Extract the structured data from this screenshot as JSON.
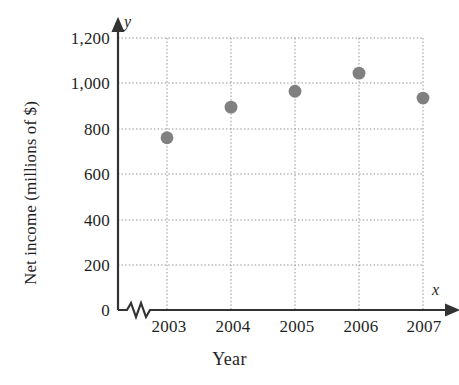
{
  "chart_data": {
    "type": "scatter",
    "title": "",
    "xlabel": "Year",
    "ylabel": "Net income (millions of $)",
    "x_axis_variable": "x",
    "y_axis_variable": "y",
    "categories": [
      "2003",
      "2004",
      "2005",
      "2006",
      "2007"
    ],
    "x": [
      2003,
      2004,
      2005,
      2006,
      2007
    ],
    "values": [
      760,
      895,
      965,
      1045,
      935
    ],
    "series": [
      {
        "name": "Net income",
        "values": [
          760,
          895,
          965,
          1045,
          935
        ]
      }
    ],
    "points": [
      {
        "label": "2003",
        "x": 2003,
        "y": 760
      },
      {
        "label": "2004",
        "x": 2004,
        "y": 895
      },
      {
        "label": "2005",
        "x": 2005,
        "y": 965
      },
      {
        "label": "2006",
        "x": 2006,
        "y": 1045
      },
      {
        "label": "2007",
        "x": 2007,
        "y": 935
      }
    ],
    "ylim": [
      0,
      1200
    ],
    "ytick_values": [
      0,
      200,
      400,
      600,
      800,
      1000,
      1200
    ],
    "ytick_labels": [
      "0",
      "200",
      "400",
      "600",
      "800",
      "1,000",
      "1,200"
    ],
    "xtick_labels": [
      "2003",
      "2004",
      "2005",
      "2006",
      "2007"
    ],
    "grid": "dotted-both-axes",
    "legend": "none",
    "axis_break": "zigzag-on-x-axis-near-origin",
    "marker_color": "#808080",
    "grid_color": "#9a9a9a",
    "axis_color": "#333333"
  },
  "labels": {
    "y_ticks": {
      "t0": "0",
      "t200": "200",
      "t400": "400",
      "t600": "600",
      "t800": "800",
      "t1000": "1,000",
      "t1200": "1,200"
    },
    "x_ticks": {
      "y2003": "2003",
      "y2004": "2004",
      "y2005": "2005",
      "y2006": "2006",
      "y2007": "2007"
    },
    "y_axis_title": "Net income (millions of $)",
    "x_axis_title": "Year",
    "y_variable": "y",
    "x_variable": "x"
  }
}
